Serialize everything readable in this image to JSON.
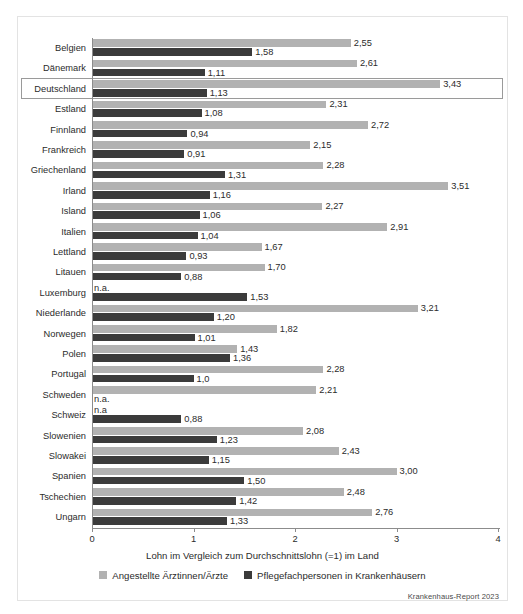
{
  "figure": {
    "source_note": "Krankenhaus-Report 2023",
    "highlighted_category": "Deutschland",
    "colors": {
      "series_light": "#b2b2b2",
      "series_dark": "#3b3b3b",
      "axis": "#8c8c8c",
      "text": "#2b2b2b",
      "frame": "#e3e3e3",
      "highlight_box": "#9a9a9a"
    }
  },
  "chart_data": {
    "type": "bar",
    "orientation": "horizontal",
    "title": "",
    "xlabel": "Lohn im Vergleich zum Durchschnittslohn (=1) im Land",
    "ylabel": "",
    "xlim": [
      0,
      4
    ],
    "xticks": [
      0,
      1,
      2,
      3,
      4
    ],
    "xtick_labels": [
      "0",
      "1",
      "2",
      "3",
      "4"
    ],
    "grid": false,
    "legend_position": "bottom",
    "categories": [
      "Belgien",
      "Dänemark",
      "Deutschland",
      "Estland",
      "Finnland",
      "Frankreich",
      "Griechenland",
      "Irland",
      "Island",
      "Italien",
      "Lettland",
      "Litauen",
      "Luxemburg",
      "Niederlande",
      "Norwegen",
      "Polen",
      "Portugal",
      "Schweden",
      "Schweiz",
      "Slowenien",
      "Slowakei",
      "Spanien",
      "Tschechien",
      "Ungarn"
    ],
    "series": [
      {
        "name": "Angestellte Ärztinnen/Ärzte",
        "color": "#b2b2b2",
        "values": [
          2.55,
          2.61,
          3.43,
          2.31,
          2.72,
          2.15,
          2.28,
          3.51,
          2.27,
          2.91,
          1.67,
          1.7,
          null,
          3.21,
          1.82,
          1.43,
          2.28,
          2.21,
          null,
          2.08,
          2.43,
          3.0,
          2.48,
          2.76
        ],
        "labels": [
          "2,55",
          "2,61",
          "3,43",
          "2,31",
          "2,72",
          "2,15",
          "2,28",
          "3,51",
          "2,27",
          "2,91",
          "1,67",
          "1,70",
          "n.a.",
          "3,21",
          "1,82",
          "1,43",
          "2,28",
          "2,21",
          "n.a",
          "2,08",
          "2,43",
          "3,00",
          "2,48",
          "2,76"
        ]
      },
      {
        "name": "Pflegefachpersonen in Krankenhäusern",
        "color": "#3b3b3b",
        "values": [
          1.58,
          1.11,
          1.13,
          1.08,
          0.94,
          0.91,
          1.31,
          1.16,
          1.06,
          1.04,
          0.93,
          0.88,
          1.53,
          1.2,
          1.01,
          1.36,
          1.0,
          null,
          0.88,
          1.23,
          1.15,
          1.5,
          1.42,
          1.33
        ],
        "labels": [
          "1,58",
          "1,11",
          "1,13",
          "1,08",
          "0,94",
          "0,91",
          "1,31",
          "1,16",
          "1,06",
          "1,04",
          "0,93",
          "0,88",
          "1,53",
          "1,20",
          "1,01",
          "1,36",
          "1,0",
          "n.a.",
          "0,88",
          "1,23",
          "1,15",
          "1,50",
          "1,42",
          "1,33"
        ]
      }
    ]
  }
}
